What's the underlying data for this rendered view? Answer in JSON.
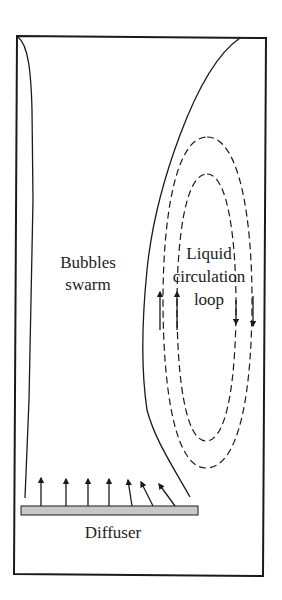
{
  "diagram": {
    "labels": {
      "bubbles_line1": "Bubbles",
      "bubbles_line2": "swarm",
      "liquid_line1": "Liquid",
      "liquid_line2": "circulation",
      "liquid_line3": "loop",
      "diffuser": "Diffuser"
    },
    "colors": {
      "stroke": "#1a1a1a",
      "diffuser_fill": "#c8c8c8",
      "background": "#ffffff"
    },
    "elements": {
      "column_wall": "rectangular column outline",
      "plume_boundary_left": "solid curve near left wall",
      "plume_boundary_right": "solid curve from top right down to diffuser end",
      "circulation_outer": "dashed closed loop",
      "circulation_inner": "dashed closed loop",
      "upward_arrows_count": 2,
      "downward_arrows_count": 2,
      "diffuser_arrows_count": 7
    }
  }
}
